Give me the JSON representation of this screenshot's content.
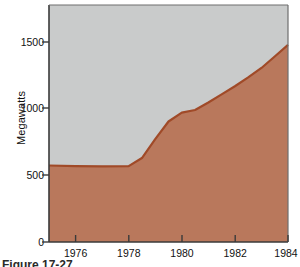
{
  "figure": {
    "caption": "Figure 17-27",
    "caption_visible_note": "cut off at bottom edge"
  },
  "colors": {
    "lower_area_fill": "#b9785c",
    "upper_area_fill": "#c9cbcb",
    "curve_line": "#a04a28",
    "axis_line": "#3a3a3a",
    "text": "#111111"
  },
  "chart_data": {
    "type": "area",
    "title": "",
    "subtitle": "",
    "xlabel": "",
    "ylabel": "Megawatts",
    "xlim": [
      1975,
      1984
    ],
    "ylim": [
      0,
      1750
    ],
    "grid": false,
    "legend": null,
    "xticks": [
      1976,
      1978,
      1980,
      1982,
      1984
    ],
    "xtick_labels": [
      "1976",
      "1978",
      "1980",
      "1982",
      "1984"
    ],
    "yticks": [
      0,
      500,
      1000,
      1500
    ],
    "ytick_labels": [
      "0",
      "500",
      "1000",
      "1500"
    ],
    "series": [
      {
        "name": "Megawatts",
        "fill_color": "#b9785c",
        "line_color": "#a04a28",
        "x": [
          1975.0,
          1976.0,
          1977.0,
          1978.0,
          1978.5,
          1979.0,
          1979.5,
          1980.0,
          1980.5,
          1981.0,
          1981.5,
          1982.0,
          1982.5,
          1983.0,
          1983.5,
          1984.0
        ],
        "values": [
          565,
          560,
          558,
          560,
          620,
          760,
          890,
          955,
          975,
          1030,
          1090,
          1150,
          1215,
          1285,
          1370,
          1455
        ]
      }
    ],
    "background_band": {
      "name": "upper background area",
      "fill_color": "#c9cbcb",
      "description": "plot region above the plotted curve, filled light gray to the top of the axes"
    },
    "annotations": []
  }
}
